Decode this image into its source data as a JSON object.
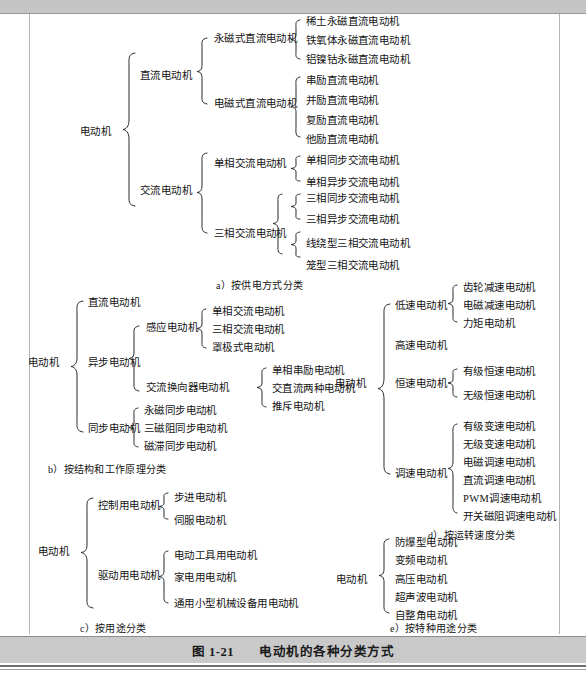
{
  "figure": {
    "caption_number": "图 1-21",
    "caption_title": "电动机的各种分类方式"
  },
  "sections": {
    "a": {
      "label": "a）按供电方式分类",
      "root": "电动机",
      "level1": [
        "直流电动机",
        "交流电动机"
      ],
      "groups": [
        {
          "parent": "直流电动机",
          "name": "永磁式直流电动机",
          "children": [
            "稀土永磁直流电动机",
            "铁氧体永磁直流电动机",
            "铝镍钴永磁直流电动机"
          ]
        },
        {
          "parent": "直流电动机",
          "name": "电磁式直流电动机",
          "children": [
            "串励直流电动机",
            "并励直流电动机",
            "复励直流电动机",
            "他励直流电动机"
          ]
        },
        {
          "parent": "交流电动机",
          "name": "单相交流电动机",
          "children": [
            "单相同步交流电动机",
            "单相异步交流电动机"
          ]
        },
        {
          "parent": "交流电动机",
          "name": "三相交流电动机",
          "children": [
            "三相同步交流电动机",
            "三相异步交流电动机",
            "线绕型三相交流电动机",
            "笼型三相交流电动机"
          ]
        }
      ]
    },
    "b": {
      "label": "b）按结构和工作原理分类",
      "root": "电动机",
      "level1": [
        "直流电动机",
        "异步电动机",
        "同步电动机"
      ],
      "groups": [
        {
          "parent": "异步电动机",
          "name": "感应电动机",
          "children": [
            "单相交流电动机",
            "三相交流电动机",
            "罩极式电动机"
          ]
        },
        {
          "parent": "异步电动机",
          "name": "交流换向器电动机",
          "children": [
            "单相串励电动机",
            "交直流两种电动机",
            "推斥电动机"
          ]
        },
        {
          "parent": "同步电动机",
          "name": "",
          "children": [
            "永磁同步电动机",
            "三磁阻同步电动机",
            "磁滞同步电动机"
          ]
        }
      ]
    },
    "c": {
      "label": "c）按用途分类",
      "root": "电动机",
      "groups": [
        {
          "name": "控制用电动机",
          "children": [
            "步进电动机",
            "伺服电动机"
          ]
        },
        {
          "name": "驱动用电动机",
          "children": [
            "电动工具用电动机",
            "家电用电动机",
            "通用小型机械设备用电动机"
          ]
        }
      ]
    },
    "d": {
      "label": "d）按运转速度分类",
      "root": "电动机",
      "groups": [
        {
          "name": "低速电动机",
          "children": [
            "齿轮减速电动机",
            "电磁减速电动机",
            "力矩电动机"
          ]
        },
        {
          "name": "高速电动机",
          "children": []
        },
        {
          "name": "恒速电动机",
          "children": [
            "有级恒速电动机",
            "无级恒速电动机"
          ]
        },
        {
          "name": "调速电动机",
          "children": [
            "有级变速电动机",
            "无级变速电动机",
            "电磁调速电动机",
            "直流调速电动机",
            "PWM调速电动机",
            "开关磁阻调速电动机"
          ]
        }
      ]
    },
    "e": {
      "label": "e）按特种用途分类",
      "root": "电动机",
      "children": [
        "防爆型电动机",
        "变频电动机",
        "高压电动机",
        "超声波电动机",
        "自整角电动机"
      ]
    }
  },
  "colors": {
    "page_background": "#ffffff",
    "band": "#c5c5c5",
    "caption_bar": "#c9c9c9",
    "text": "#141414",
    "rule": "#b4b4b4"
  }
}
